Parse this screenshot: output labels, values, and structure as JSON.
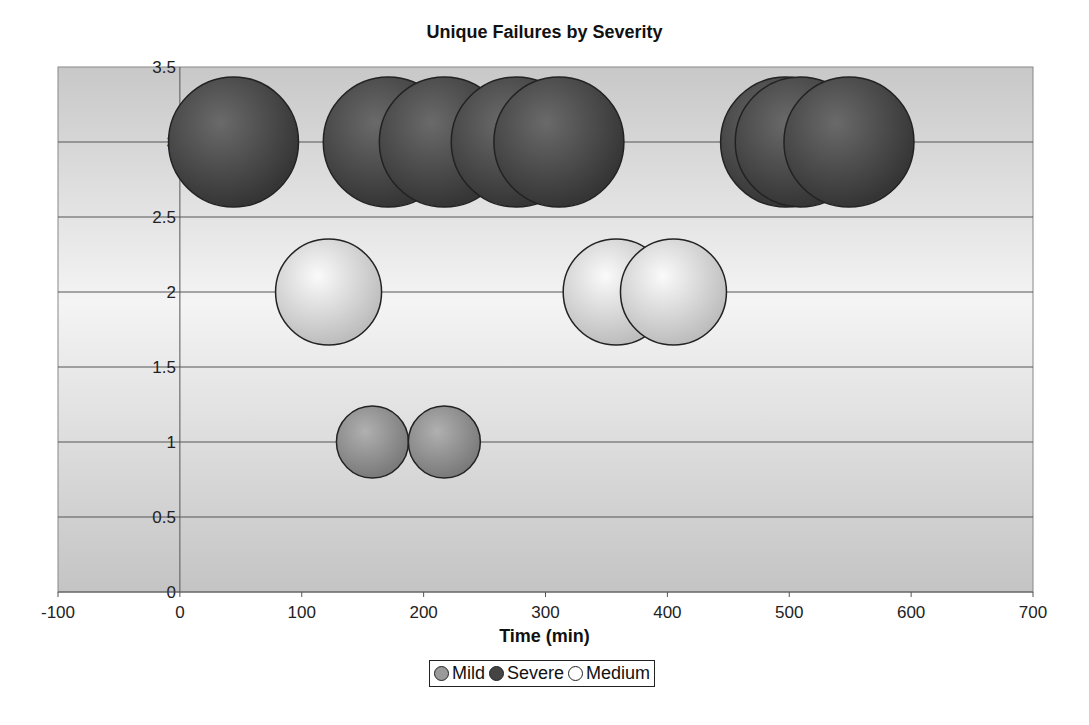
{
  "chart_data": {
    "type": "scatter",
    "subtype": "bubble",
    "title": "Unique Failures by Severity",
    "xlabel": "Time (min)",
    "ylabel": "",
    "xlim": [
      -100,
      700
    ],
    "ylim": [
      0,
      3.5
    ],
    "x_ticks": [
      -100,
      0,
      100,
      200,
      300,
      400,
      500,
      600,
      700
    ],
    "y_ticks": [
      0,
      0.5,
      1,
      1.5,
      2,
      2.5,
      3,
      3.5
    ],
    "grid": "horizontal",
    "legend_position": "bottom",
    "series": [
      {
        "name": "Mild",
        "color": "#8c8c8c",
        "radius_px": 36,
        "points": [
          {
            "x": 158,
            "y": 1
          },
          {
            "x": 217,
            "y": 1
          }
        ]
      },
      {
        "name": "Severe",
        "color": "#3e3e3e",
        "radius_px": 65,
        "points": [
          {
            "x": 44,
            "y": 3
          },
          {
            "x": 171,
            "y": 3
          },
          {
            "x": 217,
            "y": 3
          },
          {
            "x": 276,
            "y": 3
          },
          {
            "x": 311,
            "y": 3
          },
          {
            "x": 497,
            "y": 3
          },
          {
            "x": 509,
            "y": 3
          },
          {
            "x": 549,
            "y": 3
          }
        ]
      },
      {
        "name": "Medium",
        "color": "#e6e6e6",
        "radius_px": 53,
        "points": [
          {
            "x": 122,
            "y": 2
          },
          {
            "x": 358,
            "y": 2
          },
          {
            "x": 405,
            "y": 2
          }
        ]
      }
    ]
  },
  "legend": {
    "items": [
      {
        "label": "Mild"
      },
      {
        "label": "Severe"
      },
      {
        "label": "Medium"
      }
    ]
  }
}
